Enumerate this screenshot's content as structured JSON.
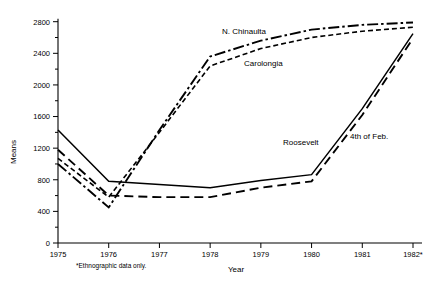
{
  "chart_data": {
    "type": "line",
    "title": "",
    "xlabel": "Year",
    "ylabel": "Means",
    "x": [
      "1975",
      "1976",
      "1977",
      "1978",
      "1979",
      "1980",
      "1981",
      "1982*"
    ],
    "xlim": [
      1975,
      1982
    ],
    "ylim": [
      0,
      2900
    ],
    "ytick_labels": [
      "0",
      "400",
      "800",
      "1200",
      "1600",
      "2000",
      "2400",
      "2800"
    ],
    "ytick_values": [
      0,
      400,
      800,
      1200,
      1600,
      2000,
      2400,
      2800
    ],
    "ytick_minor_values": [
      200,
      600,
      1000,
      1400,
      1800,
      2200,
      2600
    ],
    "grid": false,
    "legend_position": "inline-annotations",
    "footnote": "*Ethnographic data only.",
    "series": [
      {
        "name": "N. Chinaulta",
        "line_style": "dash-dot",
        "label_x": "1978",
        "values": [
          1000,
          450,
          1430,
          2360,
          2560,
          2700,
          2760,
          2790
        ]
      },
      {
        "name": "Carolongia",
        "line_style": "dotted-dash",
        "label_x": "1978",
        "values": [
          1070,
          580,
          1400,
          2240,
          2460,
          2600,
          2680,
          2730
        ]
      },
      {
        "name": "Roosevelt",
        "line_style": "solid",
        "label_x": "1979",
        "values": [
          1430,
          780,
          740,
          700,
          790,
          865,
          1700,
          2650
        ]
      },
      {
        "name": "4th of Feb.",
        "line_style": "dashed",
        "label_x": "1980",
        "values": [
          1180,
          600,
          580,
          580,
          700,
          780,
          1620,
          2590
        ]
      }
    ]
  },
  "annotations": [
    {
      "text": "N. Chinaulta",
      "x": 222,
      "y": 34
    },
    {
      "text": "Carolongia",
      "x": 244,
      "y": 66
    },
    {
      "text": "Roosevelt",
      "x": 283,
      "y": 145
    },
    {
      "text": "4th of Feb.",
      "x": 350,
      "y": 139
    }
  ],
  "axis": {
    "y_title": "Means",
    "x_title": "Year",
    "footnote": "*Ethnographic data only."
  }
}
